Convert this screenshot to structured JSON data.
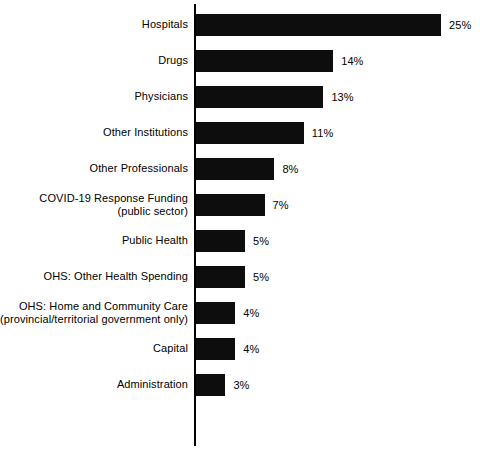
{
  "chart_data": {
    "type": "bar",
    "orientation": "horizontal",
    "title": "",
    "subtitle": "",
    "xlabel": "",
    "ylabel": "",
    "grid": false,
    "legend": "none",
    "axis": {
      "show_category_spine": true,
      "xlim": [
        0,
        25
      ]
    },
    "value_suffix": "%",
    "categories": [
      "Hospitals",
      "Drugs",
      "Physicians",
      "Other Institutions",
      "Other Professionals",
      "COVID-19 Response Funding (public sector)",
      "Public Health",
      "OHS: Other Health Spending",
      "OHS: Home and Community Care (provincial/territorial government only)",
      "Capital",
      "Administration"
    ],
    "values": [
      25,
      14,
      13,
      11,
      8,
      7,
      5,
      5,
      4,
      4,
      3
    ],
    "data_labels": [
      "25%",
      "14%",
      "13%",
      "11%",
      "8%",
      "7%",
      "5%",
      "5%",
      "4%",
      "4%",
      "3%"
    ],
    "colors": {
      "bar": "#0d0d0d",
      "axis": "#000000",
      "background": "#ffffff",
      "text": "#000000"
    }
  },
  "bars": [
    {
      "label_line1": "Hospitals",
      "label_line2": "",
      "value": 25,
      "value_label": "25%"
    },
    {
      "label_line1": "Drugs",
      "label_line2": "",
      "value": 14,
      "value_label": "14%"
    },
    {
      "label_line1": "Physicians",
      "label_line2": "",
      "value": 13,
      "value_label": "13%"
    },
    {
      "label_line1": "Other Institutions",
      "label_line2": "",
      "value": 11,
      "value_label": "11%"
    },
    {
      "label_line1": "Other Professionals",
      "label_line2": "",
      "value": 8,
      "value_label": "8%"
    },
    {
      "label_line1": "COVID-19 Response Funding",
      "label_line2": "(public sector)",
      "value": 7,
      "value_label": "7%"
    },
    {
      "label_line1": "Public Health",
      "label_line2": "",
      "value": 5,
      "value_label": "5%"
    },
    {
      "label_line1": "OHS: Other Health Spending",
      "label_line2": "",
      "value": 5,
      "value_label": "5%"
    },
    {
      "label_line1": "OHS: Home and Community Care",
      "label_line2": "(provincial/territorial government only)",
      "value": 4,
      "value_label": "4%"
    },
    {
      "label_line1": "Capital",
      "label_line2": "",
      "value": 4,
      "value_label": "4%"
    },
    {
      "label_line1": "Administration",
      "label_line2": "",
      "value": 3,
      "value_label": "3%"
    }
  ],
  "layout": {
    "row_pitch": 36,
    "first_row_top": 7,
    "px_per_percent": 9.8,
    "bar_origin_x": 196,
    "value_gap": 8
  }
}
